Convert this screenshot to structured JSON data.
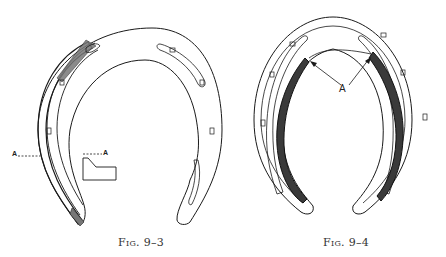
{
  "figures": [
    {
      "id": "fig-9-3",
      "caption": "Fig. 9–3",
      "section_marker_left": "A",
      "section_marker_right": "A",
      "description": "Horseshoe with hatched outer left branch and section A–A inset"
    },
    {
      "id": "fig-9-4",
      "caption": "Fig. 9–4",
      "pointer_label": "A",
      "description": "Horseshoe with heavily shaded inner rim on both branches, arrows labeled A"
    }
  ],
  "colors": {
    "line": "#1a1a1a",
    "hatch": "#555555",
    "background": "#ffffff"
  }
}
